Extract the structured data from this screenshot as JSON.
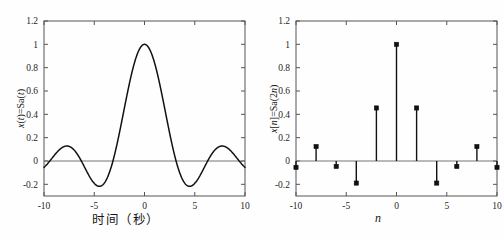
{
  "figure": {
    "background_color": "#fefefe",
    "axis_color": "#555555",
    "curve_color": "#111111",
    "zero_line_color": "#666666"
  },
  "chart_data": [
    {
      "type": "line",
      "panel": "left",
      "title": "",
      "xlabel": "时间（秒）",
      "ylabel": "x(t)=Sa(t)",
      "ylabel_parts": {
        "pre": "x",
        "var": "t",
        "eq": "(",
        "mid": ")=Sa(",
        "post": ")"
      },
      "xlim": [
        -10,
        10
      ],
      "ylim": [
        -0.3,
        1.2
      ],
      "xticks": [
        -10,
        -5,
        0,
        5,
        10
      ],
      "xticklabels": [
        "-10",
        "-5",
        "0",
        "5",
        "10"
      ],
      "yticks": [
        -0.2,
        0,
        0.2,
        0.4,
        0.6,
        0.8,
        1,
        1.2
      ],
      "yticklabels": [
        "-0.2",
        "0",
        "0.2",
        "0.4",
        "0.6",
        "0.8",
        "1",
        "1.2"
      ],
      "grid": false,
      "legend": null,
      "function": "Sa(t) = sin(t)/t",
      "x": [
        -10,
        -9.5,
        -9,
        -8.5,
        -8,
        -7.5,
        -7,
        -6.5,
        -6,
        -5.5,
        -5,
        -4.5,
        -4,
        -3.5,
        -3,
        -2.5,
        -2,
        -1.5,
        -1,
        -0.5,
        0,
        0.5,
        1,
        1.5,
        2,
        2.5,
        3,
        3.5,
        4,
        4.5,
        5,
        5.5,
        6,
        6.5,
        7,
        7.5,
        8,
        8.5,
        9,
        9.5,
        10
      ],
      "values": [
        -0.0544,
        -0.0792,
        -0.0458,
        0.0932,
        0.1237,
        0.1252,
        0.0939,
        0.0335,
        -0.0466,
        -0.128,
        -0.1918,
        -0.2172,
        -0.1892,
        -0.1002,
        0.047,
        0.2394,
        0.4546,
        0.665,
        0.8415,
        0.9589,
        1.0,
        0.9589,
        0.8415,
        0.665,
        0.4546,
        0.2394,
        0.047,
        -0.1002,
        -0.1892,
        -0.2172,
        -0.1918,
        -0.128,
        -0.0466,
        0.0335,
        0.0939,
        0.1252,
        0.1237,
        0.0932,
        -0.0458,
        -0.0792,
        -0.0544
      ],
      "key_points": {
        "peak": {
          "x": 0,
          "y": 1.0
        },
        "first_minima": [
          {
            "x": -4.49,
            "y": -0.2172
          },
          {
            "x": 4.49,
            "y": -0.2172
          }
        ],
        "second_maxima": [
          {
            "x": -7.73,
            "y": 0.1284
          },
          {
            "x": 7.73,
            "y": 0.1284
          }
        ],
        "zero_crossings": [
          -9.42,
          -6.28,
          -3.14,
          3.14,
          6.28,
          9.42
        ]
      }
    },
    {
      "type": "stem",
      "panel": "right",
      "title": "",
      "xlabel": "n",
      "ylabel": "x[n]=Sa(2n)",
      "ylabel_parts": {
        "pre": "x",
        "var": "n",
        "mid": "]=Sa(2",
        "post": ")"
      },
      "xlim": [
        -10,
        10
      ],
      "ylim": [
        -0.3,
        1.2
      ],
      "xticks": [
        -10,
        -5,
        0,
        5,
        10
      ],
      "xticklabels": [
        "-10",
        "-5",
        "0",
        "5",
        "10"
      ],
      "yticks": [
        -0.2,
        0,
        0.2,
        0.4,
        0.6,
        0.8,
        1,
        1.2
      ],
      "yticklabels": [
        "-0.2",
        "0",
        "0.2",
        "0.4",
        "0.6",
        "0.8",
        "1",
        "1.2"
      ],
      "grid": false,
      "legend": null,
      "function": "Sa(2n) = sin(2n)/(2n)",
      "marker": "filled-square",
      "x": [
        -10,
        -8,
        -6,
        -4,
        -2,
        0,
        2,
        4,
        6,
        8,
        10
      ],
      "values": [
        -0.0544,
        0.1237,
        -0.0466,
        -0.1892,
        0.4546,
        1.0,
        0.4546,
        -0.1892,
        -0.0466,
        0.1237,
        -0.0544
      ]
    }
  ]
}
